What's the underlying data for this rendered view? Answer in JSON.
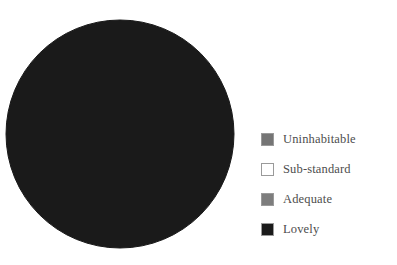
{
  "chart_data": {
    "type": "pie",
    "title": "",
    "categories": [
      "Uninhabitable",
      "Sub-standard",
      "Adequate",
      "Lovely"
    ],
    "values": [
      0,
      0,
      0,
      100
    ],
    "units": "percent",
    "colors": [
      "#757575",
      "#ffffff",
      "#7d7d7d",
      "#1a1a1a"
    ],
    "legend_position": "right",
    "grid": false,
    "start_angle_deg": 90,
    "direction": "counterclockwise",
    "annotations": []
  },
  "figure": {
    "background": "#ffffff",
    "pie": {
      "center_x": 120,
      "center_y": 134,
      "radius": 114,
      "dominant_color": "#1a1a1a",
      "edge_color": "#1a1a1a"
    }
  },
  "legend": {
    "items": [
      {
        "label": "Uninhabitable",
        "color": "#757575"
      },
      {
        "label": "Sub-standard",
        "color": "#ffffff"
      },
      {
        "label": "Adequate",
        "color": "#7d7d7d"
      },
      {
        "label": "Lovely",
        "color": "#1a1a1a"
      }
    ],
    "text_color": "#4d4d4d",
    "border_color": "#9a9a9a"
  }
}
